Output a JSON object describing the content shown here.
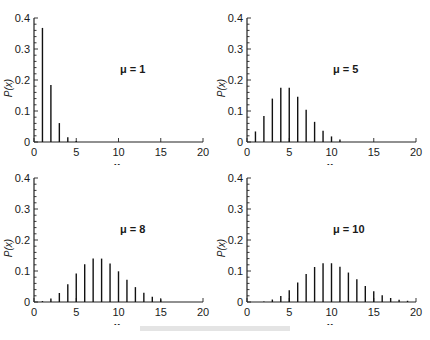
{
  "chart_data": [
    {
      "type": "bar",
      "title": "",
      "annotation": "μ = 1",
      "xlabel": "x",
      "ylabel": "P(x)",
      "xlim": [
        0,
        20
      ],
      "ylim": [
        0,
        0.4
      ],
      "xticks": [
        "0",
        "5",
        "10",
        "15",
        "20"
      ],
      "yticks": [
        "0",
        "0.1",
        "0.2",
        "0.3",
        "0.4"
      ],
      "grid": false,
      "x": [
        1,
        2,
        3,
        4,
        5
      ],
      "values": [
        0.368,
        0.184,
        0.061,
        0.015,
        0.003
      ]
    },
    {
      "type": "bar",
      "title": "",
      "annotation": "μ = 5",
      "xlabel": "x",
      "ylabel": "P(x)",
      "xlim": [
        0,
        20
      ],
      "ylim": [
        0,
        0.4
      ],
      "xticks": [
        "0",
        "5",
        "10",
        "15",
        "20"
      ],
      "yticks": [
        "0",
        "0.1",
        "0.2",
        "0.3",
        "0.4"
      ],
      "grid": false,
      "x": [
        1,
        2,
        3,
        4,
        5,
        6,
        7,
        8,
        9,
        10,
        11
      ],
      "values": [
        0.034,
        0.084,
        0.14,
        0.175,
        0.175,
        0.146,
        0.104,
        0.065,
        0.036,
        0.018,
        0.008
      ]
    },
    {
      "type": "bar",
      "title": "",
      "annotation": "μ = 8",
      "xlabel": "x",
      "ylabel": "P(x)",
      "xlim": [
        0,
        20
      ],
      "ylim": [
        0,
        0.4
      ],
      "xticks": [
        "0",
        "5",
        "10",
        "15",
        "20"
      ],
      "yticks": [
        "0",
        "0.1",
        "0.2",
        "0.3",
        "0.4"
      ],
      "grid": false,
      "x": [
        1,
        2,
        3,
        4,
        5,
        6,
        7,
        8,
        9,
        10,
        11,
        12,
        13,
        14,
        15
      ],
      "values": [
        0.003,
        0.011,
        0.029,
        0.057,
        0.092,
        0.122,
        0.14,
        0.14,
        0.124,
        0.099,
        0.072,
        0.048,
        0.03,
        0.017,
        0.009
      ]
    },
    {
      "type": "bar",
      "title": "",
      "annotation": "μ = 10",
      "xlabel": "x",
      "ylabel": "P(x)",
      "xlim": [
        0,
        20
      ],
      "ylim": [
        0,
        0.4
      ],
      "xticks": [
        "0",
        "5",
        "10",
        "15",
        "20"
      ],
      "yticks": [
        "0",
        "0.1",
        "0.2",
        "0.3",
        "0.4"
      ],
      "grid": false,
      "x": [
        2,
        3,
        4,
        5,
        6,
        7,
        8,
        9,
        10,
        11,
        12,
        13,
        14,
        15,
        16,
        17,
        18,
        19
      ],
      "values": [
        0.002,
        0.008,
        0.019,
        0.038,
        0.063,
        0.09,
        0.113,
        0.125,
        0.125,
        0.114,
        0.095,
        0.073,
        0.052,
        0.035,
        0.022,
        0.013,
        0.007,
        0.004
      ]
    }
  ],
  "panels": [
    {
      "left": 0,
      "top": 0
    },
    {
      "left": 213,
      "top": 0
    },
    {
      "left": 0,
      "top": 160
    },
    {
      "left": 213,
      "top": 160
    }
  ]
}
